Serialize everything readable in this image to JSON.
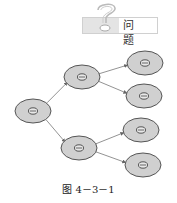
{
  "header": {
    "label": "问 题",
    "icon": "question-mark-icon"
  },
  "diagram": {
    "colors": {
      "cell_fill": "#d0d0d0",
      "cell_stroke": "#555555",
      "arrow": "#777777"
    },
    "nodes": [
      {
        "id": "root",
        "cx": 33,
        "cy": 111,
        "level": 0
      },
      {
        "id": "mid-top",
        "cx": 82,
        "cy": 77,
        "level": 1
      },
      {
        "id": "mid-bottom",
        "cx": 79,
        "cy": 148,
        "level": 1
      },
      {
        "id": "leaf-1",
        "cx": 145,
        "cy": 63,
        "level": 2
      },
      {
        "id": "leaf-2",
        "cx": 144,
        "cy": 96,
        "level": 2
      },
      {
        "id": "leaf-3",
        "cx": 141,
        "cy": 130,
        "level": 2
      },
      {
        "id": "leaf-4",
        "cx": 143,
        "cy": 165,
        "level": 2
      }
    ],
    "edges": [
      [
        "root",
        "mid-top"
      ],
      [
        "root",
        "mid-bottom"
      ],
      [
        "mid-top",
        "leaf-1"
      ],
      [
        "mid-top",
        "leaf-2"
      ],
      [
        "mid-bottom",
        "leaf-3"
      ],
      [
        "mid-bottom",
        "leaf-4"
      ]
    ]
  },
  "caption": "图 4－3－1"
}
